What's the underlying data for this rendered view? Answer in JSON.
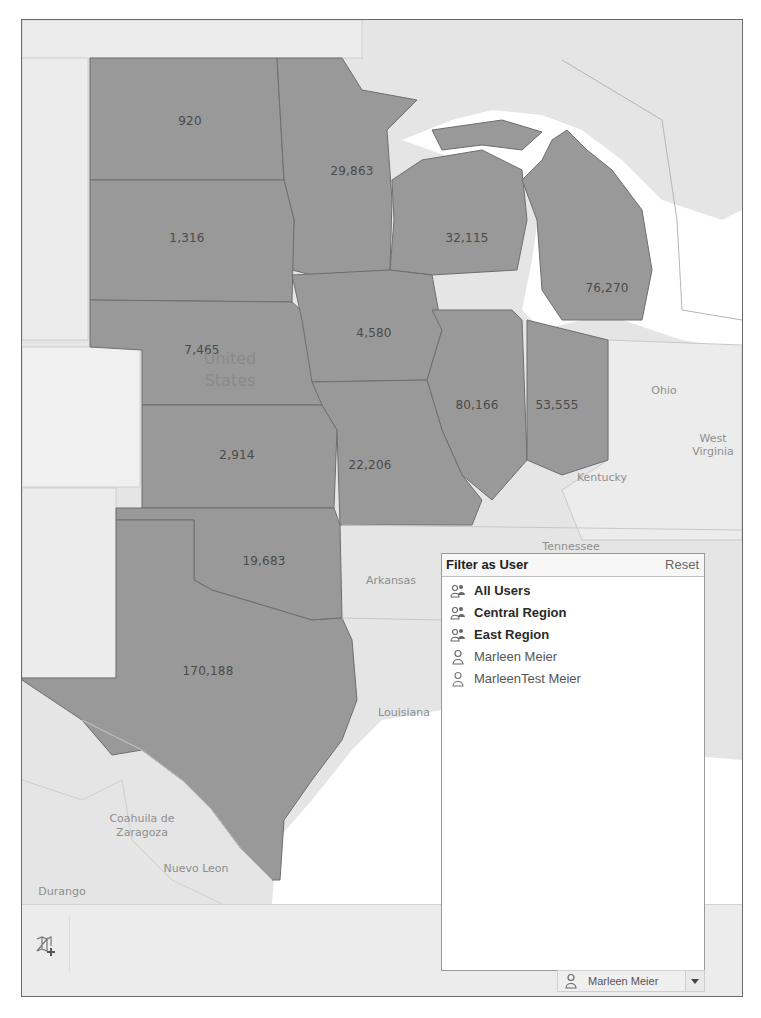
{
  "map": {
    "fill_color": "#999999",
    "background_color": "#e4e4e4",
    "water_color": "#ffffff",
    "state_values": [
      {
        "state": "North Dakota",
        "value": "920"
      },
      {
        "state": "Minnesota",
        "value": "29,863"
      },
      {
        "state": "South Dakota",
        "value": "1,316"
      },
      {
        "state": "Wisconsin",
        "value": "32,115"
      },
      {
        "state": "Michigan",
        "value": "76,270"
      },
      {
        "state": "Nebraska",
        "value": "7,465"
      },
      {
        "state": "Iowa",
        "value": "4,580"
      },
      {
        "state": "Illinois",
        "value": "80,166"
      },
      {
        "state": "Indiana",
        "value": "53,555"
      },
      {
        "state": "Kansas",
        "value": "2,914"
      },
      {
        "state": "Missouri",
        "value": "22,206"
      },
      {
        "state": "Oklahoma",
        "value": "19,683"
      },
      {
        "state": "Texas",
        "value": "170,188"
      }
    ],
    "geo_labels": {
      "country": "United States",
      "ohio": "Ohio",
      "west_virginia": "West Virginia",
      "kentucky": "Kentucky",
      "tennessee": "Tennessee",
      "arkansas": "Arkansas",
      "louisiana": "Louisiana",
      "coahuila": "Coahuila de Zaragoza",
      "nuevo_leon": "Nuevo Leon",
      "durango": "Durango"
    }
  },
  "filter_popup": {
    "title": "Filter as User",
    "reset_label": "Reset",
    "items": [
      {
        "label": "All Users",
        "type": "group",
        "icon": "users-group-icon"
      },
      {
        "label": "Central Region",
        "type": "group",
        "icon": "users-group-icon"
      },
      {
        "label": "East Region",
        "type": "group",
        "icon": "users-group-icon"
      },
      {
        "label": "Marleen Meier",
        "type": "user",
        "icon": "user-icon"
      },
      {
        "label": "MarleenTest Meier",
        "type": "user",
        "icon": "user-icon"
      }
    ]
  },
  "toolbar": {
    "map_add_icon": "map-plus-icon",
    "current_user": "Marleen Meier"
  }
}
